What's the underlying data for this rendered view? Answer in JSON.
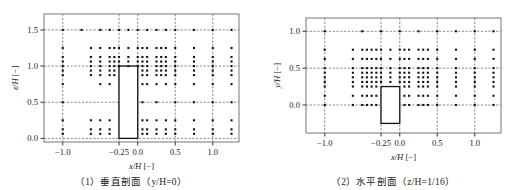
{
  "figure": {
    "panels": [
      {
        "id": "vertical-section",
        "caption": "（1）垂直剖面（y/H=0）",
        "xlabel": "x/H [−]",
        "ylabel": "z/H [−]",
        "xticks": [
          "−1.0",
          "−0.25",
          "0.0",
          "0.5",
          "1.0"
        ],
        "yticks": [
          "0.0",
          "0.5",
          "1.0",
          "1.5"
        ]
      },
      {
        "id": "horizontal-section",
        "caption": "（2）水平剖面（z/H=1/16）",
        "xlabel": "x/H [−]",
        "ylabel": "y/H [−]",
        "xticks": [
          "−1.0",
          "−0.25",
          "0.0",
          "0.5",
          "1.0"
        ],
        "yticks": [
          "0.0",
          "0.5",
          "1.0"
        ]
      }
    ]
  },
  "chart_data": [
    {
      "type": "scatter",
      "title": "（1）垂直剖面（y/H=0）",
      "xlabel": "x/H [−]",
      "ylabel": "z/H [−]",
      "xlim": [
        -1.25,
        1.35
      ],
      "ylim": [
        -0.05,
        1.72
      ],
      "xticks": [
        -1.0,
        -0.25,
        0.0,
        0.5,
        1.0
      ],
      "yticks": [
        0.0,
        0.5,
        1.0,
        1.5
      ],
      "grid": true,
      "gridstyle": "dashed",
      "legend": null,
      "marker": "square",
      "marker_color": "#111111",
      "obstacle": {
        "x0": -0.25,
        "x1": 0.0,
        "y0": 0.0,
        "y1": 1.0,
        "edge_color": "#111111"
      },
      "points": [
        [
          -1.0,
          1.5
        ],
        [
          -0.75,
          1.5
        ],
        [
          -0.5,
          1.5
        ],
        [
          -0.375,
          1.5
        ],
        [
          -0.25,
          1.5
        ],
        [
          -0.125,
          1.5
        ],
        [
          0.0,
          1.5
        ],
        [
          0.125,
          1.5
        ],
        [
          0.25,
          1.5
        ],
        [
          0.375,
          1.5
        ],
        [
          0.5,
          1.5
        ],
        [
          0.75,
          1.5
        ],
        [
          1.0,
          1.5
        ],
        [
          1.25,
          1.5
        ],
        [
          -1.0,
          1.25
        ],
        [
          -0.625,
          1.25
        ],
        [
          -0.5,
          1.25
        ],
        [
          -0.375,
          1.25
        ],
        [
          -0.3125,
          1.25
        ],
        [
          -0.25,
          1.25
        ],
        [
          -0.125,
          1.25
        ],
        [
          0.0,
          1.25
        ],
        [
          0.0625,
          1.25
        ],
        [
          0.125,
          1.25
        ],
        [
          0.25,
          1.25
        ],
        [
          0.3125,
          1.25
        ],
        [
          0.375,
          1.25
        ],
        [
          0.5,
          1.25
        ],
        [
          0.75,
          1.25
        ],
        [
          1.0,
          1.25
        ],
        [
          1.25,
          1.25
        ],
        [
          -1.0,
          1.125
        ],
        [
          -0.625,
          1.125
        ],
        [
          -0.5,
          1.125
        ],
        [
          -0.375,
          1.125
        ],
        [
          -0.3125,
          1.125
        ],
        [
          -0.25,
          1.125
        ],
        [
          -0.125,
          1.125
        ],
        [
          0.0,
          1.125
        ],
        [
          0.0625,
          1.125
        ],
        [
          0.125,
          1.125
        ],
        [
          0.25,
          1.125
        ],
        [
          0.3125,
          1.125
        ],
        [
          0.375,
          1.125
        ],
        [
          0.5,
          1.125
        ],
        [
          0.75,
          1.125
        ],
        [
          1.0,
          1.125
        ],
        [
          1.25,
          1.125
        ],
        [
          -1.0,
          1.0625
        ],
        [
          -0.625,
          1.0625
        ],
        [
          -0.5,
          1.0625
        ],
        [
          -0.375,
          1.0625
        ],
        [
          -0.3125,
          1.0625
        ],
        [
          -0.25,
          1.0625
        ],
        [
          -0.125,
          1.0625
        ],
        [
          0.0,
          1.0625
        ],
        [
          0.0625,
          1.0625
        ],
        [
          0.125,
          1.0625
        ],
        [
          0.25,
          1.0625
        ],
        [
          0.3125,
          1.0625
        ],
        [
          0.375,
          1.0625
        ],
        [
          0.5,
          1.0625
        ],
        [
          0.75,
          1.0625
        ],
        [
          1.0,
          1.0625
        ],
        [
          1.25,
          1.0625
        ],
        [
          -1.0,
          1.0
        ],
        [
          -0.625,
          1.0
        ],
        [
          -0.5,
          1.0
        ],
        [
          -0.375,
          1.0
        ],
        [
          -0.3125,
          1.0
        ],
        [
          -0.25,
          1.0
        ],
        [
          -0.125,
          1.0
        ],
        [
          0.0,
          1.0
        ],
        [
          0.0625,
          1.0
        ],
        [
          0.125,
          1.0
        ],
        [
          0.25,
          1.0
        ],
        [
          0.3125,
          1.0
        ],
        [
          0.375,
          1.0
        ],
        [
          0.5,
          1.0
        ],
        [
          0.75,
          1.0
        ],
        [
          1.0,
          1.0
        ],
        [
          1.25,
          1.0
        ],
        [
          -1.0,
          0.9375
        ],
        [
          -0.625,
          0.9375
        ],
        [
          -0.5,
          0.9375
        ],
        [
          -0.375,
          0.9375
        ],
        [
          -0.3125,
          0.9375
        ],
        [
          0.0625,
          0.9375
        ],
        [
          0.125,
          0.9375
        ],
        [
          0.25,
          0.9375
        ],
        [
          0.3125,
          0.9375
        ],
        [
          0.375,
          0.9375
        ],
        [
          0.5,
          0.9375
        ],
        [
          0.75,
          0.9375
        ],
        [
          1.0,
          0.9375
        ],
        [
          1.25,
          0.9375
        ],
        [
          -1.0,
          0.875
        ],
        [
          -0.625,
          0.875
        ],
        [
          -0.5,
          0.875
        ],
        [
          -0.375,
          0.875
        ],
        [
          -0.3125,
          0.875
        ],
        [
          0.0625,
          0.875
        ],
        [
          0.125,
          0.875
        ],
        [
          0.25,
          0.875
        ],
        [
          0.3125,
          0.875
        ],
        [
          0.375,
          0.875
        ],
        [
          0.5,
          0.875
        ],
        [
          0.75,
          0.875
        ],
        [
          1.0,
          0.875
        ],
        [
          1.25,
          0.875
        ],
        [
          -1.0,
          0.75
        ],
        [
          -0.5,
          0.75
        ],
        [
          -0.375,
          0.75
        ],
        [
          0.0625,
          0.75
        ],
        [
          0.125,
          0.75
        ],
        [
          0.25,
          0.75
        ],
        [
          0.375,
          0.75
        ],
        [
          0.5,
          0.75
        ],
        [
          0.75,
          0.75
        ],
        [
          1.0,
          0.75
        ],
        [
          1.25,
          0.75
        ],
        [
          -1.0,
          0.5
        ],
        [
          0.0625,
          0.5
        ],
        [
          0.25,
          0.5
        ],
        [
          0.5,
          0.5
        ],
        [
          0.75,
          0.5
        ],
        [
          1.0,
          0.5
        ],
        [
          1.25,
          0.5
        ],
        [
          -1.0,
          0.25
        ],
        [
          -0.625,
          0.25
        ],
        [
          -0.5,
          0.25
        ],
        [
          -0.375,
          0.25
        ],
        [
          0.0625,
          0.25
        ],
        [
          0.125,
          0.25
        ],
        [
          0.25,
          0.25
        ],
        [
          0.375,
          0.25
        ],
        [
          0.5,
          0.25
        ],
        [
          0.75,
          0.25
        ],
        [
          1.0,
          0.25
        ],
        [
          1.25,
          0.25
        ],
        [
          -1.0,
          0.125
        ],
        [
          -0.625,
          0.125
        ],
        [
          -0.5,
          0.125
        ],
        [
          -0.375,
          0.125
        ],
        [
          0.0625,
          0.125
        ],
        [
          0.125,
          0.125
        ],
        [
          0.25,
          0.125
        ],
        [
          0.375,
          0.125
        ],
        [
          0.5,
          0.125
        ],
        [
          0.75,
          0.125
        ],
        [
          1.0,
          0.125
        ],
        [
          1.25,
          0.125
        ],
        [
          -1.0,
          0.0625
        ],
        [
          -0.625,
          0.0625
        ],
        [
          -0.5,
          0.0625
        ],
        [
          -0.375,
          0.0625
        ],
        [
          0.0625,
          0.0625
        ],
        [
          0.125,
          0.0625
        ],
        [
          0.25,
          0.0625
        ],
        [
          0.375,
          0.0625
        ],
        [
          0.5,
          0.0625
        ],
        [
          0.75,
          0.0625
        ],
        [
          1.0,
          0.0625
        ],
        [
          1.25,
          0.0625
        ]
      ]
    },
    {
      "type": "scatter",
      "title": "（2）水平剖面（z/H=1/16）",
      "xlabel": "x/H [−]",
      "ylabel": "y/H [−]",
      "xlim": [
        -1.25,
        1.35
      ],
      "ylim": [
        -0.38,
        1.18
      ],
      "xticks": [
        -1.0,
        -0.25,
        0.0,
        0.5,
        1.0
      ],
      "yticks": [
        0.0,
        0.5,
        1.0
      ],
      "grid": true,
      "gridstyle": "dashed",
      "legend": null,
      "marker": "square",
      "marker_color": "#111111",
      "obstacle": {
        "x0": -0.25,
        "x1": 0.0,
        "y0": -0.25,
        "y1": 0.25,
        "edge_color": "#111111"
      },
      "points": [
        [
          -1.0,
          1.0
        ],
        [
          -0.5,
          1.0
        ],
        [
          -0.25,
          1.0
        ],
        [
          0.0,
          1.0
        ],
        [
          0.25,
          1.0
        ],
        [
          0.5,
          1.0
        ],
        [
          0.75,
          1.0
        ],
        [
          1.0,
          1.0
        ],
        [
          1.25,
          1.0
        ],
        [
          -1.0,
          0.75
        ],
        [
          -0.625,
          0.75
        ],
        [
          -0.5,
          0.75
        ],
        [
          -0.4375,
          0.75
        ],
        [
          -0.375,
          0.75
        ],
        [
          -0.3125,
          0.75
        ],
        [
          -0.25,
          0.75
        ],
        [
          -0.125,
          0.75
        ],
        [
          0.0,
          0.75
        ],
        [
          0.0625,
          0.75
        ],
        [
          0.125,
          0.75
        ],
        [
          0.25,
          0.75
        ],
        [
          0.3125,
          0.75
        ],
        [
          0.375,
          0.75
        ],
        [
          0.5,
          0.75
        ],
        [
          0.75,
          0.75
        ],
        [
          1.0,
          0.75
        ],
        [
          1.25,
          0.75
        ],
        [
          -1.0,
          0.625
        ],
        [
          -0.625,
          0.625
        ],
        [
          -0.5,
          0.625
        ],
        [
          -0.4375,
          0.625
        ],
        [
          -0.375,
          0.625
        ],
        [
          -0.3125,
          0.625
        ],
        [
          -0.25,
          0.625
        ],
        [
          -0.125,
          0.625
        ],
        [
          0.0,
          0.625
        ],
        [
          0.0625,
          0.625
        ],
        [
          0.125,
          0.625
        ],
        [
          0.25,
          0.625
        ],
        [
          0.3125,
          0.625
        ],
        [
          0.375,
          0.625
        ],
        [
          0.5,
          0.625
        ],
        [
          0.75,
          0.625
        ],
        [
          1.0,
          0.625
        ],
        [
          1.25,
          0.625
        ],
        [
          -1.0,
          0.5
        ],
        [
          -0.625,
          0.5
        ],
        [
          -0.5,
          0.5
        ],
        [
          -0.4375,
          0.5
        ],
        [
          -0.375,
          0.5
        ],
        [
          -0.3125,
          0.5
        ],
        [
          -0.25,
          0.5
        ],
        [
          -0.125,
          0.5
        ],
        [
          0.0,
          0.5
        ],
        [
          0.0625,
          0.5
        ],
        [
          0.125,
          0.5
        ],
        [
          0.25,
          0.5
        ],
        [
          0.3125,
          0.5
        ],
        [
          0.375,
          0.5
        ],
        [
          0.5,
          0.5
        ],
        [
          0.75,
          0.5
        ],
        [
          1.0,
          0.5
        ],
        [
          1.25,
          0.5
        ],
        [
          -1.0,
          0.4375
        ],
        [
          -0.625,
          0.4375
        ],
        [
          -0.5,
          0.4375
        ],
        [
          -0.4375,
          0.4375
        ],
        [
          -0.375,
          0.4375
        ],
        [
          -0.3125,
          0.4375
        ],
        [
          -0.25,
          0.4375
        ],
        [
          -0.125,
          0.4375
        ],
        [
          0.0,
          0.4375
        ],
        [
          0.0625,
          0.4375
        ],
        [
          0.125,
          0.4375
        ],
        [
          0.25,
          0.4375
        ],
        [
          0.3125,
          0.4375
        ],
        [
          0.375,
          0.4375
        ],
        [
          0.5,
          0.4375
        ],
        [
          0.75,
          0.4375
        ],
        [
          1.0,
          0.4375
        ],
        [
          1.25,
          0.4375
        ],
        [
          -1.0,
          0.375
        ],
        [
          -0.625,
          0.375
        ],
        [
          -0.5,
          0.375
        ],
        [
          -0.4375,
          0.375
        ],
        [
          -0.375,
          0.375
        ],
        [
          -0.3125,
          0.375
        ],
        [
          -0.25,
          0.375
        ],
        [
          -0.125,
          0.375
        ],
        [
          0.0,
          0.375
        ],
        [
          0.0625,
          0.375
        ],
        [
          0.125,
          0.375
        ],
        [
          0.25,
          0.375
        ],
        [
          0.3125,
          0.375
        ],
        [
          0.375,
          0.375
        ],
        [
          0.5,
          0.375
        ],
        [
          0.75,
          0.375
        ],
        [
          1.0,
          0.375
        ],
        [
          1.25,
          0.375
        ],
        [
          -1.0,
          0.3125
        ],
        [
          -0.625,
          0.3125
        ],
        [
          -0.5,
          0.3125
        ],
        [
          -0.4375,
          0.3125
        ],
        [
          -0.375,
          0.3125
        ],
        [
          -0.3125,
          0.3125
        ],
        [
          -0.25,
          0.3125
        ],
        [
          -0.125,
          0.3125
        ],
        [
          0.0,
          0.3125
        ],
        [
          0.0625,
          0.3125
        ],
        [
          0.125,
          0.3125
        ],
        [
          0.25,
          0.3125
        ],
        [
          0.3125,
          0.3125
        ],
        [
          0.375,
          0.3125
        ],
        [
          0.5,
          0.3125
        ],
        [
          0.75,
          0.3125
        ],
        [
          1.0,
          0.3125
        ],
        [
          1.25,
          0.3125
        ],
        [
          -1.0,
          0.25
        ],
        [
          -0.625,
          0.25
        ],
        [
          -0.5,
          0.25
        ],
        [
          -0.4375,
          0.25
        ],
        [
          -0.375,
          0.25
        ],
        [
          -0.3125,
          0.25
        ],
        [
          0.0625,
          0.25
        ],
        [
          0.125,
          0.25
        ],
        [
          0.25,
          0.25
        ],
        [
          0.3125,
          0.25
        ],
        [
          0.375,
          0.25
        ],
        [
          0.5,
          0.25
        ],
        [
          0.75,
          0.25
        ],
        [
          1.0,
          0.25
        ],
        [
          1.25,
          0.25
        ],
        [
          -1.0,
          0.125
        ],
        [
          -0.625,
          0.125
        ],
        [
          -0.5,
          0.125
        ],
        [
          -0.4375,
          0.125
        ],
        [
          -0.375,
          0.125
        ],
        [
          -0.3125,
          0.125
        ],
        [
          0.0625,
          0.125
        ],
        [
          0.125,
          0.125
        ],
        [
          0.25,
          0.125
        ],
        [
          0.3125,
          0.125
        ],
        [
          0.375,
          0.125
        ],
        [
          0.5,
          0.125
        ],
        [
          0.75,
          0.125
        ],
        [
          1.0,
          0.125
        ],
        [
          1.25,
          0.125
        ],
        [
          -1.0,
          0.0
        ],
        [
          -0.625,
          0.0
        ],
        [
          -0.5,
          0.0
        ],
        [
          -0.4375,
          0.0
        ],
        [
          -0.375,
          0.0
        ],
        [
          -0.3125,
          0.0
        ],
        [
          0.0625,
          0.0
        ],
        [
          0.125,
          0.0
        ],
        [
          0.25,
          0.0
        ],
        [
          0.3125,
          0.0
        ],
        [
          0.375,
          0.0
        ],
        [
          0.5,
          0.0
        ],
        [
          0.75,
          0.0
        ],
        [
          1.0,
          0.0
        ],
        [
          1.25,
          0.0
        ]
      ]
    }
  ]
}
